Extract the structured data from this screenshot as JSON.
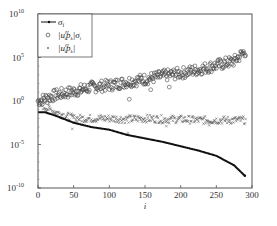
{
  "chart_data": {
    "type": "scatter",
    "title": "",
    "xlabel": "i",
    "ylabel": "",
    "xlim": [
      0,
      300
    ],
    "ylim_log10": [
      -10,
      10
    ],
    "yscale": "log",
    "grid": false,
    "legend_position": "upper left",
    "x_ticks": [
      "0",
      "50",
      "100",
      "150",
      "200",
      "250",
      "300"
    ],
    "y_ticks": [
      {
        "base": "10",
        "exp": "10"
      },
      {
        "base": "10",
        "exp": "5"
      },
      {
        "base": "10",
        "exp": "0"
      },
      {
        "base": "10",
        "exp": "-5"
      },
      {
        "base": "10",
        "exp": "-10"
      }
    ],
    "series": [
      {
        "name": "σ_i",
        "legend_label": "σ",
        "legend_sub": "i",
        "marker": "line-dot",
        "color": "#111111",
        "x": [
          0,
          10,
          25,
          50,
          75,
          100,
          125,
          150,
          175,
          200,
          225,
          250,
          275,
          290
        ],
        "log10_y": [
          -1.3,
          -1.3,
          -1.7,
          -2.5,
          -3.0,
          -3.3,
          -3.9,
          -4.3,
          -4.7,
          -5.2,
          -5.7,
          -6.3,
          -7.4,
          -8.6
        ]
      },
      {
        "name": "|u_i^H p_k| σ_i",
        "legend_label": "|u",
        "legend_mid": "p",
        "legend_tail": "|σ",
        "marker": "circle",
        "color": "#444444",
        "x": [
          0,
          25,
          50,
          75,
          100,
          125,
          150,
          175,
          200,
          225,
          250,
          275,
          290
        ],
        "log10_y": [
          0.0,
          0.7,
          1.1,
          1.6,
          1.8,
          2.2,
          2.5,
          2.9,
          3.2,
          3.6,
          4.1,
          4.6,
          5.7
        ],
        "outliers": [
          {
            "x": 128,
            "log10_y": 0.2
          },
          {
            "x": 158,
            "log10_y": 1.3
          },
          {
            "x": 184,
            "log10_y": 1.6
          },
          {
            "x": 60,
            "log10_y": 1.0
          }
        ]
      },
      {
        "name": "|u_i^H p_k|",
        "legend_label": "|u",
        "legend_mid": "p",
        "legend_tail": "|",
        "marker": "x",
        "color": "#555555",
        "x": [
          0,
          25,
          50,
          75,
          100,
          125,
          150,
          175,
          200,
          225,
          250,
          275,
          290
        ],
        "log10_y": [
          -0.3,
          -1.3,
          -2.0,
          -2.0,
          -2.0,
          -2.1,
          -2.0,
          -2.1,
          -2.1,
          -2.2,
          -2.2,
          -2.2,
          -2.2
        ],
        "outliers": [
          {
            "x": 48,
            "log10_y": -3.2
          },
          {
            "x": 126,
            "log10_y": -3.7
          },
          {
            "x": 180,
            "log10_y": -2.9
          },
          {
            "x": 240,
            "log10_y": -2.8
          }
        ]
      }
    ]
  }
}
